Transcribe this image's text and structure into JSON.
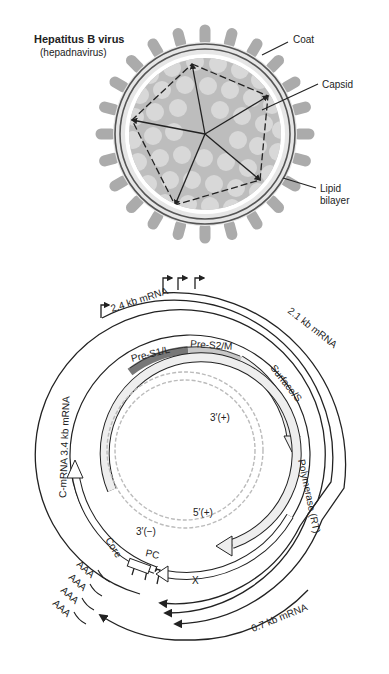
{
  "virion": {
    "title": "Hepatitus B virus",
    "subtitle": "(hepadnavirus)",
    "labels": {
      "coat": "Coat",
      "capsid": "Capsid",
      "lipid_line1": "Lipid",
      "lipid_line2": "bilayer"
    }
  },
  "genome": {
    "transcripts": {
      "mrna_24": "2.4 kb mRNA",
      "mrna_21": "2.1 kb mRNA",
      "mrna_34": "C-mRNA  3.4 kb mRNA",
      "mrna_07": "0.7 kb mRNA"
    },
    "orfs": {
      "pre_s1": "Pre-S1/L",
      "pre_s2": "Pre-S2/M",
      "surface": "Surface/S",
      "polymerase": "Polymerase (RT)",
      "core": "Core",
      "pc": "PC",
      "x": "X"
    },
    "dna_ends": {
      "three_plus": "3′(+)",
      "five_plus": "5′(+)",
      "three_minus": "3′(−)"
    },
    "polya": [
      "AAA",
      "AAA",
      "AAA",
      "AAA"
    ]
  },
  "colors": {
    "spike": "#aaaaaa",
    "capsid_bg": "#bdbdbd",
    "capsomer": "#d6d6d6",
    "pre_s1": "#777777",
    "pre_s2": "#c8c8c8",
    "orf_fill": "#ececec",
    "dna": "#b8b8b8",
    "line": "#222222"
  }
}
